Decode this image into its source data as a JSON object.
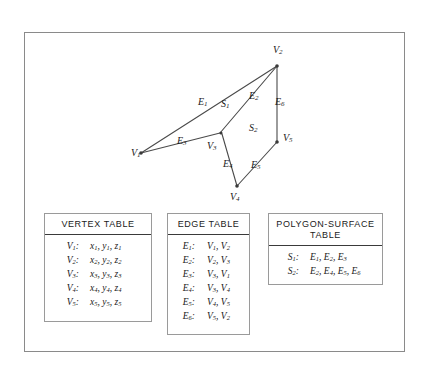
{
  "figure": {
    "diagram": {
      "vertex_labels": [
        {
          "name": "V",
          "sub": "1",
          "x": 131,
          "y": 147
        },
        {
          "name": "V",
          "sub": "2",
          "x": 273,
          "y": 48
        },
        {
          "name": "V",
          "sub": "3",
          "x": 209,
          "y": 142
        },
        {
          "name": "V",
          "sub": "4",
          "x": 231,
          "y": 191
        },
        {
          "name": "V",
          "sub": "5",
          "x": 283,
          "y": 136
        }
      ],
      "edge_labels": [
        {
          "name": "E",
          "sub": "1",
          "x": 200,
          "y": 99
        },
        {
          "name": "E",
          "sub": "2",
          "x": 250,
          "y": 94
        },
        {
          "name": "E",
          "sub": "3",
          "x": 178,
          "y": 138
        },
        {
          "name": "E",
          "sub": "4",
          "x": 224,
          "y": 160
        },
        {
          "name": "E",
          "sub": "5",
          "x": 252,
          "y": 161
        },
        {
          "name": "E",
          "sub": "6",
          "x": 276,
          "y": 99
        }
      ],
      "surface_labels": [
        {
          "name": "S",
          "sub": "1",
          "x": 223,
          "y": 101
        },
        {
          "name": "S",
          "sub": "2",
          "x": 250,
          "y": 125
        }
      ],
      "points": {
        "V1": [
          141,
          153
        ],
        "V2": [
          277,
          66
        ],
        "V3": [
          220,
          133
        ],
        "V4": [
          237,
          186
        ],
        "V5": [
          277,
          142
        ]
      },
      "stroke_color": "#4a4a4a"
    },
    "vertex_table": {
      "title": "VERTEX TABLE",
      "rows": [
        {
          "key": "V",
          "key_sub": "1",
          "value": "x",
          "v1": "1",
          "value2": "y",
          "v2": "1",
          "value3": "z",
          "v3": "1"
        },
        {
          "key": "V",
          "key_sub": "2",
          "value": "x",
          "v1": "2",
          "value2": "y",
          "v2": "2",
          "value3": "z",
          "v3": "2"
        },
        {
          "key": "V",
          "key_sub": "3",
          "value": "x",
          "v1": "3",
          "value2": "y",
          "v2": "3",
          "value3": "z",
          "v3": "3"
        },
        {
          "key": "V",
          "key_sub": "4",
          "value": "x",
          "v1": "4",
          "value2": "y",
          "v2": "4",
          "value3": "z",
          "v3": "4"
        },
        {
          "key": "V",
          "key_sub": "5",
          "value": "x",
          "v1": "5",
          "value2": "y",
          "v2": "5",
          "value3": "z",
          "v3": "5"
        }
      ]
    },
    "edge_table": {
      "title": "EDGE TABLE",
      "rows": [
        {
          "key": "E",
          "key_sub": "1",
          "a": "V",
          "a_sub": "1",
          "b": "V",
          "b_sub": "2"
        },
        {
          "key": "E",
          "key_sub": "2",
          "a": "V",
          "a_sub": "2",
          "b": "V",
          "b_sub": "3"
        },
        {
          "key": "E",
          "key_sub": "3",
          "a": "V",
          "a_sub": "3",
          "b": "V",
          "b_sub": "1"
        },
        {
          "key": "E",
          "key_sub": "4",
          "a": "V",
          "a_sub": "3",
          "b": "V",
          "b_sub": "4"
        },
        {
          "key": "E",
          "key_sub": "5",
          "a": "V",
          "a_sub": "4",
          "b": "V",
          "b_sub": "5"
        },
        {
          "key": "E",
          "key_sub": "6",
          "a": "V",
          "a_sub": "5",
          "b": "V",
          "b_sub": "2"
        }
      ]
    },
    "polygon_table": {
      "title_line1": "POLYGON-SURFACE",
      "title_line2": "TABLE",
      "rows": [
        {
          "key": "S",
          "key_sub": "1",
          "items": [
            {
              "n": "E",
              "s": "1"
            },
            {
              "n": "E",
              "s": "2"
            },
            {
              "n": "E",
              "s": "3"
            }
          ]
        },
        {
          "key": "S",
          "key_sub": "2",
          "items": [
            {
              "n": "E",
              "s": "2"
            },
            {
              "n": "E",
              "s": "4"
            },
            {
              "n": "E",
              "s": "5"
            },
            {
              "n": "E",
              "s": "6"
            }
          ]
        }
      ]
    }
  }
}
